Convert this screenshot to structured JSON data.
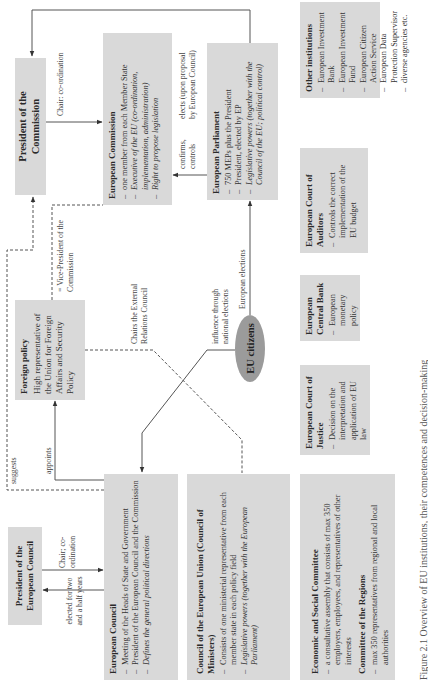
{
  "diagram": {
    "nodes": {
      "president_commission": {
        "title": "President of the Commission"
      },
      "commission": {
        "title": "European Commission",
        "items": [
          {
            "text": "one member from each Member State",
            "italic": false
          },
          {
            "text": "Executive of the EU (co-ordination, implementation, administration)",
            "italic": true
          },
          {
            "text": "Right to propose legislation",
            "italic": true
          }
        ]
      },
      "parliament": {
        "title": "European Parliament",
        "items": [
          {
            "text": "750 MEPs plus the President",
            "italic": false
          },
          {
            "text": "President, elected by EP",
            "italic": false
          },
          {
            "text": "Legislative powers (together with the Council of the EU; political control)",
            "italic": true
          }
        ]
      },
      "president_council": {
        "title": "President of the European Council"
      },
      "european_council": {
        "title": "European Council",
        "items": [
          {
            "text": "Meeting of the Heads of State and Government",
            "italic": false
          },
          {
            "text": "President of the European Council and the Commission",
            "italic": false
          },
          {
            "text": "Defines the general political directions",
            "italic": true
          }
        ]
      },
      "foreign_policy": {
        "title": "Foreign policy",
        "text": "High representative of the Union for Foreign Affairs and Security Policy"
      },
      "council_eu": {
        "title": "Council of the European Union (Council of Ministers)",
        "items": [
          {
            "text": "Consists of one ministerial representative from each member state in each policy field",
            "italic": false
          },
          {
            "text": "Legislative powers (together with the European Parliament)",
            "italic": true
          }
        ]
      },
      "eu_citizens": {
        "title": "EU citizens"
      },
      "esc": {
        "title": "Economic and Social Committee",
        "items": [
          {
            "text": "a consultative assembly that consists of max 350 employers, employees, and representatives of other interests"
          }
        ],
        "sub_title": "Committee of the Regions",
        "sub_items": [
          {
            "text": "max 350 representatives from regional and local authorities"
          }
        ]
      },
      "court_justice": {
        "title": "European Court of Justice",
        "items": [
          {
            "text": "Decision on the interpretation and application of EU law"
          }
        ]
      },
      "central_bank": {
        "title": "European Central Bank",
        "items": [
          {
            "text": "European monetary policy"
          }
        ]
      },
      "court_auditors": {
        "title": "European Court of Auditors",
        "items": [
          {
            "text": "Controls the correct implementation of the EU budget"
          }
        ]
      },
      "other": {
        "title": "Other institutions",
        "items": [
          {
            "text": "European Investment Bank"
          },
          {
            "text": "European Investment Fund"
          },
          {
            "text": "European Citizen Action Service"
          },
          {
            "text": "European Data Protection Supervisor"
          },
          {
            "text": "diverse agencies etc."
          }
        ]
      }
    },
    "edge_labels": {
      "chair_coordination_commission": "Chair: co-ordination",
      "elects": "elects (upon proposal by European Council)",
      "confirms_controls": "confirms, controls",
      "vice_president": "= Vice-President of the Commission",
      "suggests": "suggests",
      "appoints": "appoints",
      "chairs_external": "Chairs the External Relations Council",
      "influence": "influence through national elections",
      "european_elections": "European elections",
      "chair_coordination_council": "Chair; co-ordination",
      "elected_term": "elected for two and a half years"
    },
    "caption": "Figure 2.1 Overview of EU institutions, their competences and decision-making"
  },
  "colors": {
    "box_fill": "#d9d9d9",
    "citizens_fill": "#9b9b9b",
    "line": "#555555"
  }
}
